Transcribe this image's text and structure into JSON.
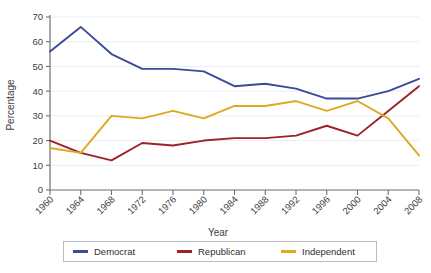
{
  "chart_data": {
    "type": "line",
    "title": "",
    "xlabel": "Year",
    "ylabel": "Percentage",
    "x": [
      1960,
      1964,
      1968,
      1972,
      1976,
      1980,
      1984,
      1988,
      1992,
      1996,
      2000,
      2004,
      2008
    ],
    "categories": [
      "1960",
      "1964",
      "1968",
      "1972",
      "1976",
      "1980",
      "1984",
      "1988",
      "1992",
      "1996",
      "2000",
      "2004",
      "2008"
    ],
    "xlim": [
      1960,
      2008
    ],
    "ylim": [
      0,
      70
    ],
    "yticks": [
      0,
      10,
      20,
      30,
      40,
      50,
      60,
      70
    ],
    "ytick_labels": [
      "0",
      "10",
      "20",
      "30",
      "40",
      "50",
      "60",
      "70"
    ],
    "grid": true,
    "grid_axis": "y",
    "legend_position": "bottom",
    "series": [
      {
        "name": "Democrat",
        "color": "#3b4a9a",
        "values": [
          56,
          66,
          55,
          49,
          49,
          48,
          42,
          43,
          41,
          37,
          37,
          40,
          45
        ]
      },
      {
        "name": "Republican",
        "color": "#9e2128",
        "values": [
          20,
          15,
          12,
          19,
          18,
          20,
          21,
          21,
          22,
          26,
          22,
          32,
          42
        ]
      },
      {
        "name": "Independent",
        "color": "#e0a81f",
        "values": [
          17,
          15,
          30,
          29,
          32,
          29,
          34,
          34,
          36,
          32,
          36,
          29,
          14
        ]
      }
    ]
  },
  "legend": {
    "items": [
      {
        "label": "Democrat",
        "color": "#3b4a9a"
      },
      {
        "label": "Republican",
        "color": "#9e2128"
      },
      {
        "label": "Independent",
        "color": "#e0a81f"
      }
    ]
  },
  "axes": {
    "y_title": "Percentage",
    "x_title": "Year"
  }
}
